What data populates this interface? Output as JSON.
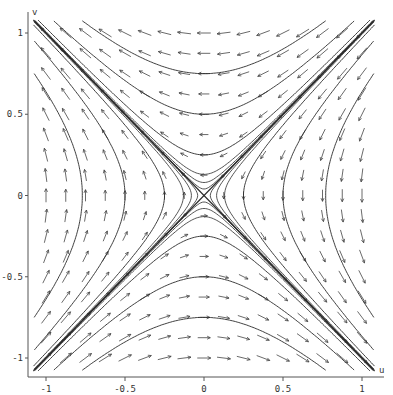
{
  "chart_data": {
    "type": "phase-portrait",
    "title": "",
    "xlabel": "u",
    "ylabel": "v",
    "system": {
      "du": "-v",
      "dv": "-u"
    },
    "xlim": [
      -1.1,
      1.1
    ],
    "ylim": [
      -1.1,
      1.1
    ],
    "xticks": [
      -1,
      -0.5,
      0,
      0.5,
      1
    ],
    "xtick_labels": [
      "-1",
      "-0.5",
      "0",
      "0.5",
      "1"
    ],
    "yticks": [
      -1,
      -0.5,
      0,
      0.5,
      1
    ],
    "ytick_labels": [
      "-1",
      "-0.5",
      "0",
      "0.5",
      "1"
    ],
    "grid": false,
    "equilibrium": {
      "u": 0,
      "v": 0,
      "kind": "saddle"
    },
    "arrow_grid": {
      "min": -1,
      "max": 1,
      "step": 0.125
    },
    "separatrices": [
      {
        "name": "stable",
        "direction": [
          1,
          1
        ]
      },
      {
        "name": "unstable",
        "direction": [
          1,
          -1
        ]
      }
    ],
    "trajectories": {
      "horizontal_family_v0": [
        0.25,
        0.5,
        0.75,
        -0.25,
        -0.5,
        -0.75
      ],
      "vertical_family_u0": [
        0.25,
        0.5,
        0.77,
        -0.25,
        -0.5,
        -0.77
      ],
      "near_separatrix_offsets": [
        0.04,
        0.08,
        0.13
      ]
    },
    "colors": {
      "curve": "#2a2a2a",
      "arrow": "#444444",
      "axis": "#555555"
    }
  }
}
